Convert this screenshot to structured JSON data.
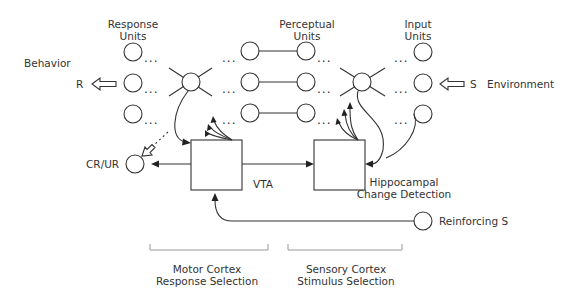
{
  "diagram": {
    "labels": {
      "behavior": "Behavior",
      "environment": "Environment",
      "r": "R",
      "s": "S",
      "response_units_line1": "Response",
      "response_units_line2": "Units",
      "perceptual_units_line1": "Perceptual",
      "perceptual_units_line2": "Units",
      "input_units_line1": "Input",
      "input_units_line2": "Units",
      "cr_ur": "CR/UR",
      "vta": "VTA",
      "hippocampal_line1": "Hippocampal",
      "hippocampal_line2": "Change Detection",
      "reinforcing_s": "Reinforcing S",
      "motor_cortex_line1": "Motor Cortex",
      "motor_cortex_line2": "Response Selection",
      "sensory_cortex_line1": "Sensory Cortex",
      "sensory_cortex_line2": "Stimulus Selection",
      "ellipsis": "..."
    },
    "colors": {
      "stroke": "#333333",
      "text": "#333333",
      "bracket": "#999999",
      "background": "#ffffff"
    }
  }
}
